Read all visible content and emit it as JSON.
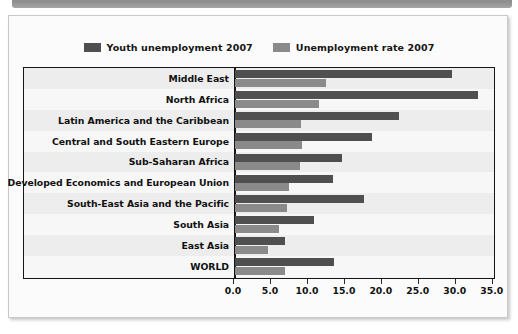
{
  "banner": {
    "name": "top-decorative-bar"
  },
  "legend": {
    "position": "top-center",
    "entries": [
      {
        "label": "Youth unemployment 2007",
        "color": "#4f4f4f",
        "swatch": "legend-swatch-youth"
      },
      {
        "label": "Unemployment rate 2007",
        "color": "#8a8a8a",
        "swatch": "legend-swatch-rate"
      }
    ]
  },
  "chart_data": {
    "type": "bar",
    "orientation": "horizontal",
    "title": "",
    "subtitle": "",
    "xlabel": "",
    "ylabel": "",
    "xlim": [
      0.0,
      35.0
    ],
    "xticks": [
      "0.0",
      "5.0",
      "10.0",
      "15.0",
      "20.0",
      "25.0",
      "30.0",
      "35.0"
    ],
    "xtick_values": [
      0.0,
      5.0,
      10.0,
      15.0,
      20.0,
      25.0,
      30.0,
      35.0
    ],
    "grid": false,
    "legend_position": "top-center",
    "categories": [
      "Middle East",
      "North Africa",
      "Latin America and the Caribbean",
      "Central and South Eastern Europe",
      "Sub-Saharan Africa",
      "Developed Economics and European Union",
      "South-East Asia and the Pacific",
      "South Asia",
      "East Asia",
      "WORLD"
    ],
    "series": [
      {
        "name": "Youth unemployment 2007",
        "color": "#4f4f4f",
        "values": [
          29.3,
          32.8,
          22.2,
          18.5,
          14.5,
          13.3,
          17.5,
          10.7,
          6.7,
          13.4
        ]
      },
      {
        "name": "Unemployment rate 2007",
        "color": "#8a8a8a",
        "values": [
          12.3,
          11.4,
          8.9,
          9.0,
          8.8,
          7.3,
          7.0,
          6.0,
          4.5,
          6.8
        ]
      }
    ]
  }
}
